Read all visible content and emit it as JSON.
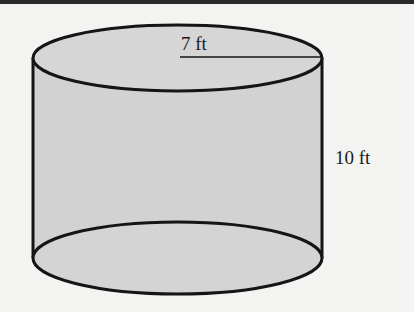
{
  "diagram": {
    "shape": "cylinder",
    "radius_label": "7 ft",
    "height_label": "10 ft",
    "colors": {
      "fill": "#cfcfcf",
      "stroke": "#151515",
      "background": "#f3f3f1"
    }
  }
}
